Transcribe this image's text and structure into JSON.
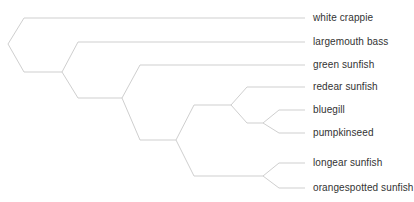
{
  "diagram": {
    "type": "phylogenetic-tree",
    "line_color": "#cfcfcf",
    "label_color": "#333333",
    "leaf_line_end_x": 305,
    "label_x": 313,
    "leaves": [
      {
        "id": "white-crappie",
        "label": "white crappie",
        "y": 18
      },
      {
        "id": "largemouth-bass",
        "label": "largemouth bass",
        "y": 42
      },
      {
        "id": "green-sunfish",
        "label": "green sunfish",
        "y": 65
      },
      {
        "id": "redear-sunfish",
        "label": "redear sunfish",
        "y": 87
      },
      {
        "id": "bluegill",
        "label": "bluegill",
        "y": 110
      },
      {
        "id": "pumpkinseed",
        "label": "pumpkinseed",
        "y": 133
      },
      {
        "id": "longear-sunfish",
        "label": "longear sunfish",
        "y": 163
      },
      {
        "id": "orangespotted-sunfish",
        "label": "orangespotted sunfish",
        "y": 188
      }
    ],
    "nodes": [
      {
        "id": "root",
        "x": 8,
        "y": 44,
        "children": [
          "white-crappie",
          "A"
        ],
        "child_x": 24
      },
      {
        "id": "A",
        "x": 62,
        "y": 72,
        "children": [
          "largemouth-bass",
          "B"
        ],
        "child_x": 78
      },
      {
        "id": "B",
        "x": 122,
        "y": 98,
        "children": [
          "green-sunfish",
          "C"
        ],
        "child_x": 140
      },
      {
        "id": "C",
        "x": 176,
        "y": 140,
        "children": [
          "D",
          "E"
        ],
        "child_x": 194
      },
      {
        "id": "D",
        "x": 231,
        "y": 105,
        "children": [
          "redear-sunfish",
          "F"
        ],
        "child_x": 247
      },
      {
        "id": "F",
        "x": 263,
        "y": 123,
        "children": [
          "bluegill",
          "pumpkinseed"
        ],
        "child_x": 279
      },
      {
        "id": "E",
        "x": 263,
        "y": 176,
        "children": [
          "longear-sunfish",
          "orangespotted-sunfish"
        ],
        "child_x": 279
      }
    ]
  }
}
